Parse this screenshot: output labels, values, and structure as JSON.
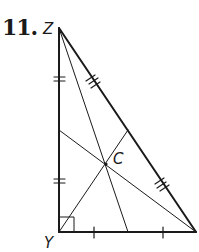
{
  "problem": {
    "number": "11."
  },
  "labels": {
    "top_vertex": "Z",
    "right_angle_vertex": "Y",
    "centroid": "C"
  },
  "diagram": {
    "type": "right triangle with medians meeting at centroid",
    "vertices": {
      "Z": [
        59,
        28
      ],
      "Y": [
        59,
        232
      ],
      "X": [
        196,
        232
      ]
    },
    "centroid": [
      106,
      164
    ],
    "right_angle_at": "Y",
    "tick_marks": {
      "ZY": "double ticks on each half",
      "YX": "single tick on each half",
      "ZX": "triple ticks on each half"
    }
  },
  "colors": {
    "line": "#1a1a1a",
    "background": "#ffffff"
  }
}
